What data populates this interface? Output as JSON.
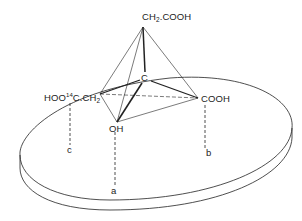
{
  "figure": {
    "apex_group": {
      "text": "CH",
      "sub": "2",
      "rest": ".COOH"
    },
    "center_atom": "C",
    "left_group": {
      "prefix": "HOO",
      "isotope": "14",
      "rest": "C.CH",
      "sub": "2"
    },
    "right_group": "COOH",
    "bottom_group": "OH",
    "binding_sites": [
      "a",
      "b",
      "c"
    ]
  },
  "colors": {
    "line": "#222222",
    "background": "#ffffff"
  }
}
